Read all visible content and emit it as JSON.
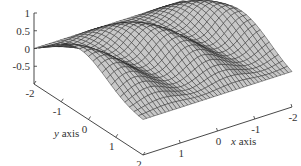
{
  "chart_data": {
    "type": "surface3d",
    "title": "",
    "xlabel": "x axis",
    "ylabel": "y axis",
    "zlabel": "",
    "x_ticks": [
      "-2",
      "-1",
      "0",
      "1",
      "2"
    ],
    "x_tick_values": [
      -2,
      -1,
      0,
      1,
      2
    ],
    "y_ticks": [
      "-2",
      "-1",
      "0",
      "1",
      "2"
    ],
    "y_tick_values": [
      -2,
      -1,
      0,
      1,
      2
    ],
    "z_ticks": [
      "1",
      "0.5",
      "0",
      "-0.5"
    ],
    "z_tick_values": [
      1,
      0.5,
      0,
      -0.5
    ],
    "xlim": [
      -2,
      2
    ],
    "ylim": [
      -2,
      2
    ],
    "zlim": [
      -1,
      1
    ],
    "grid": false,
    "surface": {
      "style": "wireframe mesh, flat gray faces",
      "face_color": "#c8c8c8",
      "edge_color": "#222222",
      "mesh_x": 40,
      "mesh_y": 24,
      "description": "wavy surface with z≈0 at the y=-2 and y=2 edges, oscillating ridges (≈3 bumps) along x, peak height ≈0.8"
    }
  },
  "axes": {
    "x_title_var": "x",
    "x_title_rest": " axis",
    "y_title_var": "y",
    "y_title_rest": " axis"
  },
  "colors": {
    "face": "#c8c8c8",
    "face_shade": "#a9a9a9",
    "edge": "#222222",
    "axis": "#333333",
    "background": "#ffffff"
  }
}
